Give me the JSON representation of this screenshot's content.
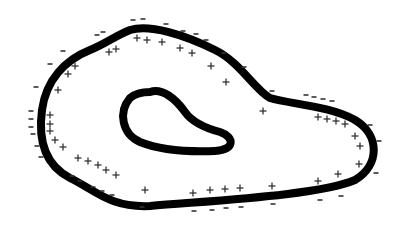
{
  "diagram": {
    "stroke_color": "#000000",
    "mark_color": "#333333",
    "outer_path": "M 130 30 C 150 24, 185 35, 215 50 C 240 62, 255 90, 270 98 C 290 104, 330 106, 355 120 C 380 135, 380 165, 355 180 C 320 195, 220 200, 150 206 C 110 208, 95 190, 70 178 C 45 165, 38 140, 42 110 C 46 80, 65 60, 90 50 C 105 44, 115 36, 130 30 Z",
    "inner_path": "M 150 92 C 162 88, 175 98, 185 112 C 192 122, 205 128, 220 132 C 235 137, 235 150, 215 151 C 190 152, 160 150, 140 142 C 122 134, 118 112, 130 98 C 136 93, 143 92, 150 92 Z",
    "plus_signs": [
      [
        137,
        38
      ],
      [
        147,
        40
      ],
      [
        162,
        42
      ],
      [
        180,
        48
      ],
      [
        192,
        53
      ],
      [
        211,
        66
      ],
      [
        226,
        82
      ],
      [
        263,
        111
      ],
      [
        109,
        52
      ],
      [
        116,
        49
      ],
      [
        75,
        66
      ],
      [
        68,
        74
      ],
      [
        58,
        90
      ],
      [
        50,
        115
      ],
      [
        50,
        124
      ],
      [
        50,
        131
      ],
      [
        55,
        140
      ],
      [
        63,
        147
      ],
      [
        78,
        158
      ],
      [
        88,
        161
      ],
      [
        98,
        165
      ],
      [
        106,
        170
      ],
      [
        116,
        175
      ],
      [
        145,
        190
      ],
      [
        193,
        193
      ],
      [
        210,
        190
      ],
      [
        225,
        189
      ],
      [
        240,
        188
      ],
      [
        272,
        186
      ],
      [
        318,
        117
      ],
      [
        327,
        119
      ],
      [
        336,
        121
      ],
      [
        345,
        124
      ],
      [
        355,
        136
      ],
      [
        360,
        146
      ],
      [
        359,
        164
      ],
      [
        338,
        174
      ],
      [
        318,
        181
      ]
    ],
    "minus_signs": [
      [
        133,
        20
      ],
      [
        143,
        19
      ],
      [
        166,
        24
      ],
      [
        183,
        31
      ],
      [
        196,
        34
      ],
      [
        206,
        40
      ],
      [
        224,
        53
      ],
      [
        244,
        67
      ],
      [
        272,
        91
      ],
      [
        97,
        35
      ],
      [
        103,
        32
      ],
      [
        63,
        51
      ],
      [
        50,
        64
      ],
      [
        36,
        87
      ],
      [
        31,
        111
      ],
      [
        31,
        119
      ],
      [
        31,
        127
      ],
      [
        33,
        134
      ],
      [
        37,
        146
      ],
      [
        41,
        157
      ],
      [
        72,
        176
      ],
      [
        80,
        181
      ],
      [
        93,
        187
      ],
      [
        102,
        191
      ],
      [
        112,
        195
      ],
      [
        142,
        207
      ],
      [
        194,
        211
      ],
      [
        212,
        210
      ],
      [
        226,
        208
      ],
      [
        241,
        207
      ],
      [
        273,
        204
      ],
      [
        306,
        95
      ],
      [
        314,
        97
      ],
      [
        323,
        99
      ],
      [
        332,
        101
      ],
      [
        370,
        125
      ],
      [
        379,
        141
      ],
      [
        376,
        173
      ],
      [
        341,
        196
      ],
      [
        320,
        200
      ]
    ]
  }
}
